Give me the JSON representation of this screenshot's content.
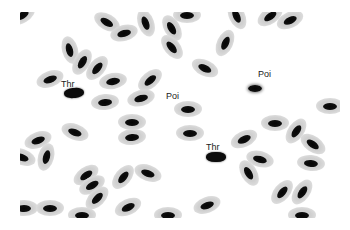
{
  "image": {
    "description": "Blood smear micrograph with nucleated oval erythrocytes",
    "background": "#ffffff",
    "cytoplasm_color": "#d4d4d4",
    "nucleus_color": "#0a0a0a"
  },
  "labels": [
    {
      "text": "Thr",
      "x": 61,
      "y": 80
    },
    {
      "text": "Poi",
      "x": 166,
      "y": 92
    },
    {
      "text": "Poi",
      "x": 258,
      "y": 70
    },
    {
      "text": "Thr",
      "x": 206,
      "y": 143
    }
  ],
  "cells": [
    {
      "x": 22,
      "y": 15,
      "r": -30,
      "type": "rbc"
    },
    {
      "x": 107,
      "y": 22,
      "r": 30,
      "type": "rbc"
    },
    {
      "x": 124,
      "y": 33,
      "r": -15,
      "type": "rbc"
    },
    {
      "x": 146,
      "y": 23,
      "r": 70,
      "type": "rbc"
    },
    {
      "x": 172,
      "y": 28,
      "r": 60,
      "type": "rbc"
    },
    {
      "x": 187,
      "y": 15,
      "r": 0,
      "type": "rbc"
    },
    {
      "x": 172,
      "y": 47,
      "r": 50,
      "type": "rbc"
    },
    {
      "x": 225,
      "y": 43,
      "r": -65,
      "type": "rbc"
    },
    {
      "x": 237,
      "y": 16,
      "r": 65,
      "type": "rbc"
    },
    {
      "x": 270,
      "y": 16,
      "r": -35,
      "type": "rbc"
    },
    {
      "x": 290,
      "y": 20,
      "r": -25,
      "type": "rbc"
    },
    {
      "x": 70,
      "y": 50,
      "r": 75,
      "type": "rbc"
    },
    {
      "x": 82,
      "y": 62,
      "r": -60,
      "type": "rbc"
    },
    {
      "x": 97,
      "y": 68,
      "r": -50,
      "type": "rbc"
    },
    {
      "x": 50,
      "y": 79,
      "r": -20,
      "type": "rbc"
    },
    {
      "x": 113,
      "y": 81,
      "r": -10,
      "type": "rbc"
    },
    {
      "x": 150,
      "y": 80,
      "r": -40,
      "type": "rbc"
    },
    {
      "x": 105,
      "y": 102,
      "r": -5,
      "type": "rbc"
    },
    {
      "x": 141,
      "y": 98,
      "r": -15,
      "type": "rbc"
    },
    {
      "x": 205,
      "y": 68,
      "r": 25,
      "type": "rbc"
    },
    {
      "x": 74,
      "y": 93,
      "r": -5,
      "type": "thr"
    },
    {
      "x": 255,
      "y": 88,
      "r": 0,
      "type": "poi"
    },
    {
      "x": 188,
      "y": 109,
      "r": 0,
      "type": "rbc"
    },
    {
      "x": 330,
      "y": 106,
      "r": 0,
      "type": "rbc"
    },
    {
      "x": 38,
      "y": 140,
      "r": -20,
      "type": "rbc"
    },
    {
      "x": 22,
      "y": 157,
      "r": 20,
      "type": "rbc"
    },
    {
      "x": 46,
      "y": 157,
      "r": -75,
      "type": "rbc"
    },
    {
      "x": 75,
      "y": 132,
      "r": 20,
      "type": "rbc"
    },
    {
      "x": 132,
      "y": 122,
      "r": 0,
      "type": "rbc"
    },
    {
      "x": 132,
      "y": 137,
      "r": -5,
      "type": "rbc"
    },
    {
      "x": 190,
      "y": 133,
      "r": 0,
      "type": "rbc"
    },
    {
      "x": 244,
      "y": 139,
      "r": -25,
      "type": "rbc"
    },
    {
      "x": 275,
      "y": 123,
      "r": 0,
      "type": "rbc"
    },
    {
      "x": 296,
      "y": 131,
      "r": -55,
      "type": "rbc"
    },
    {
      "x": 313,
      "y": 144,
      "r": 35,
      "type": "rbc"
    },
    {
      "x": 260,
      "y": 159,
      "r": 15,
      "type": "rbc"
    },
    {
      "x": 249,
      "y": 173,
      "r": 60,
      "type": "rbc"
    },
    {
      "x": 311,
      "y": 163,
      "r": 5,
      "type": "rbc"
    },
    {
      "x": 216,
      "y": 157,
      "r": 0,
      "type": "thr"
    },
    {
      "x": 86,
      "y": 175,
      "r": -35,
      "type": "rbc"
    },
    {
      "x": 92,
      "y": 185,
      "r": -30,
      "type": "rbc"
    },
    {
      "x": 97,
      "y": 198,
      "r": -45,
      "type": "rbc"
    },
    {
      "x": 123,
      "y": 177,
      "r": -50,
      "type": "rbc"
    },
    {
      "x": 148,
      "y": 173,
      "r": 20,
      "type": "rbc"
    },
    {
      "x": 24,
      "y": 208,
      "r": 0,
      "type": "rbc"
    },
    {
      "x": 50,
      "y": 208,
      "r": 0,
      "type": "rbc"
    },
    {
      "x": 128,
      "y": 207,
      "r": -25,
      "type": "rbc"
    },
    {
      "x": 82,
      "y": 215,
      "r": 0,
      "type": "rbc"
    },
    {
      "x": 168,
      "y": 215,
      "r": 0,
      "type": "rbc"
    },
    {
      "x": 207,
      "y": 205,
      "r": -20,
      "type": "rbc"
    },
    {
      "x": 282,
      "y": 192,
      "r": -50,
      "type": "rbc"
    },
    {
      "x": 302,
      "y": 192,
      "r": -55,
      "type": "rbc"
    },
    {
      "x": 302,
      "y": 215,
      "r": 0,
      "type": "rbc"
    }
  ]
}
